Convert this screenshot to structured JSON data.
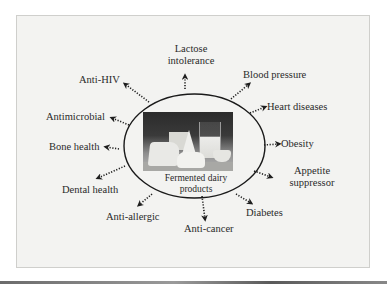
{
  "diagram": {
    "center": {
      "caption_line1": "Fermented dairy",
      "caption_line2": "products",
      "image": "dairy-products-photo"
    },
    "effects": [
      {
        "id": "lactose-intolerance",
        "line1": "Lactose",
        "line2": "intolerance"
      },
      {
        "id": "anti-hiv",
        "line1": "Anti-HIV"
      },
      {
        "id": "blood-pressure",
        "line1": "Blood pressure"
      },
      {
        "id": "heart-diseases",
        "line1": "Heart diseases"
      },
      {
        "id": "antimicrobial",
        "line1": "Antimicrobial"
      },
      {
        "id": "obesity",
        "line1": "Obesity"
      },
      {
        "id": "bone-health",
        "line1": "Bone health"
      },
      {
        "id": "appetite-suppressor",
        "line1": "Appetite",
        "line2": "suppressor"
      },
      {
        "id": "dental-health",
        "line1": "Dental health"
      },
      {
        "id": "anti-allergic",
        "line1": "Anti-allergic"
      },
      {
        "id": "diabetes",
        "line1": "Diabetes"
      },
      {
        "id": "anti-cancer",
        "line1": "Anti-cancer"
      }
    ],
    "connector_style": "dotted-arrow",
    "colors": {
      "background": "#f3f3f1",
      "ink": "#2a2a2a",
      "frame_border": "#cfcfcc"
    }
  }
}
